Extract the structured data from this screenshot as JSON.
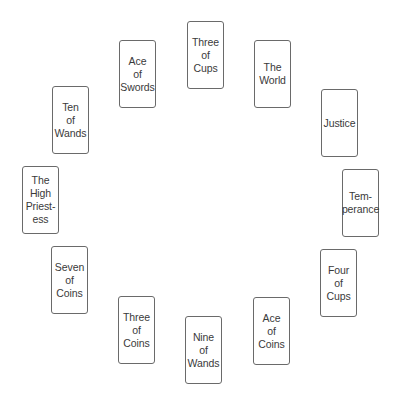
{
  "spread": {
    "layout": "circle",
    "card_width": 37,
    "card_height": 68,
    "border_color": "#6a6a6a",
    "text_color": "#3a3a3a",
    "cards": [
      {
        "id": "three-of-cups",
        "label": "Three\nof\nCups",
        "x": 187,
        "y": 21
      },
      {
        "id": "the-world",
        "label": "The\nWorld",
        "x": 254,
        "y": 40
      },
      {
        "id": "justice",
        "label": "Justice",
        "x": 321,
        "y": 89
      },
      {
        "id": "temperance",
        "label": "Tem-\nperance",
        "x": 342,
        "y": 169
      },
      {
        "id": "four-of-cups",
        "label": "Four\nof\nCups",
        "x": 320,
        "y": 249
      },
      {
        "id": "ace-of-coins",
        "label": "Ace\nof\nCoins",
        "x": 253,
        "y": 297
      },
      {
        "id": "nine-of-wands",
        "label": "Nine\nof\nWands",
        "x": 185,
        "y": 316
      },
      {
        "id": "three-of-coins",
        "label": "Three\nof\nCoins",
        "x": 118,
        "y": 296
      },
      {
        "id": "seven-of-coins",
        "label": "Seven\nof\nCoins",
        "x": 51,
        "y": 246
      },
      {
        "id": "the-high-priestess",
        "label": "The\nHigh\nPriest-\ness",
        "x": 22,
        "y": 166
      },
      {
        "id": "ten-of-wands",
        "label": "Ten\nof\nWands",
        "x": 52,
        "y": 86
      },
      {
        "id": "ace-of-swords",
        "label": "Ace\nof\nSwords",
        "x": 119,
        "y": 40
      }
    ]
  }
}
